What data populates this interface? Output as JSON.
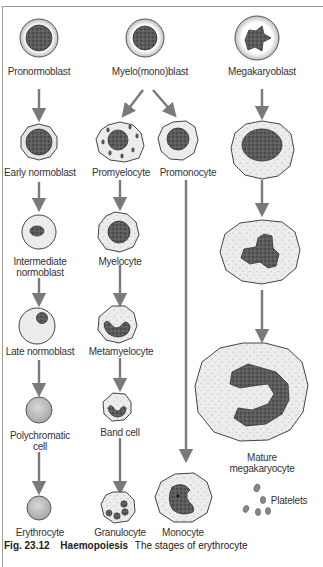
{
  "figure": {
    "caption_number": "Fig. 23.12",
    "caption_title": "Haemopoiesis",
    "caption_text": "The stages of erythrocyte"
  },
  "colors": {
    "arrow": "#7a7a7a",
    "nucleus": "#555555",
    "cytoplasm": "#e4e4e4",
    "cell_outline": "#444444",
    "frame": "#9a9a9a"
  },
  "labels": {
    "pronormoblast": "Pronormoblast",
    "myelo_mono_blast": "Myelo(mono)blast",
    "megakaryoblast": "Megakaryoblast",
    "early_normoblast": "Early normoblast",
    "promyelocyte": "Promyelocyte",
    "promonocyte": "Promonocyte",
    "intermediate_normoblast_1": "Intermediate",
    "intermediate_normoblast_2": "normoblast",
    "myelocyte": "Myelocyte",
    "late_normoblast": "Late normoblast",
    "metamyelocyte": "Metamyelocyte",
    "polychromatic_cell_1": "Polychromatic",
    "polychromatic_cell_2": "cell",
    "band_cell": "Band cell",
    "mature_megakaryocyte_1": "Mature",
    "mature_megakaryocyte_2": "megakaryocyte",
    "erythrocyte": "Erythrocyte",
    "granulocyte": "Granulocyte",
    "monocyte": "Monocyte",
    "platelets": "Platelets"
  }
}
